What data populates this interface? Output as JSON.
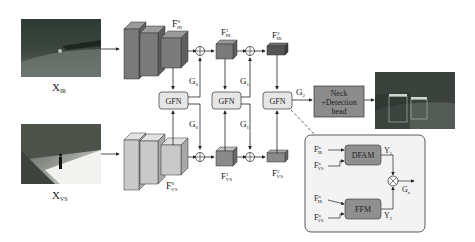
{
  "inputs": {
    "ir": {
      "label": "X",
      "sub": "IR"
    },
    "vs": {
      "label": "X",
      "sub": "VS"
    }
  },
  "features": {
    "ir0": {
      "label": "F",
      "sup": "0",
      "sub": "IR"
    },
    "ir1": {
      "label": "F",
      "sup": "1",
      "sub": "IR"
    },
    "ir2": {
      "label": "F",
      "sup": "2",
      "sub": "IR"
    },
    "vs0": {
      "label": "F",
      "sup": "0",
      "sub": "VS"
    },
    "vs1": {
      "label": "F",
      "sup": "1",
      "sub": "VS"
    },
    "vs2": {
      "label": "F",
      "sup": "2",
      "sub": "VS"
    }
  },
  "gfn": {
    "label": "GFN"
  },
  "gates": {
    "g0": {
      "label": "G",
      "sub": "0"
    },
    "g1": {
      "label": "G",
      "sub": "1"
    },
    "g2": {
      "label": "G",
      "sub": "2"
    },
    "gn": {
      "label": "G",
      "sub": "n"
    }
  },
  "head": {
    "line1": "Neck",
    "line2": "+Detection",
    "line3": "head"
  },
  "detail": {
    "dfam": "DFAM",
    "ffm": "FFM",
    "y1": {
      "label": "Y",
      "sub": "1"
    },
    "y2": {
      "label": "Y",
      "sub": "2"
    },
    "fir": {
      "label": "F",
      "sup": "n",
      "sub": "IR"
    },
    "fvs": {
      "label": "F",
      "sup": "n",
      "sub": "VS"
    }
  },
  "output_image": {
    "boxes": [
      "person 0.xx",
      "person 0.xx"
    ]
  },
  "colors": {
    "ir_block": "#7a7a7a",
    "ir_block_top": "#9a9a9a",
    "ir_block_side": "#5e5e5e",
    "vs_block": "#c9c9c9",
    "vs_block_top": "#e2e2e2",
    "vs_block_side": "#a9a9a9",
    "gfn_fill": "#e6e6e6",
    "head_fill": "#8c8c8c",
    "detail_fill": "#f3f3f3",
    "module_fill": "#8f8f8f"
  }
}
